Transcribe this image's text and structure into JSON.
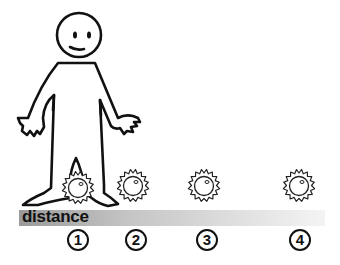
{
  "diagram": {
    "axis_label": "distance",
    "positions": [
      {
        "label": "1",
        "x": 78
      },
      {
        "label": "2",
        "x": 136
      },
      {
        "label": "3",
        "x": 207
      },
      {
        "label": "4",
        "x": 300
      }
    ],
    "colors": {
      "stroke": "#111111",
      "bar_start": "#9a9a9a",
      "bar_end": "#f4f4f4"
    }
  }
}
